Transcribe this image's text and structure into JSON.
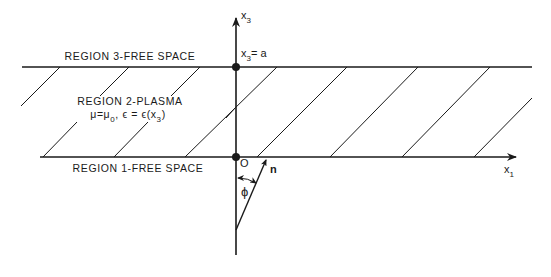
{
  "diagram": {
    "type": "layered-medium-geometry",
    "colors": {
      "line": "#1a1a1a",
      "background": "#ffffff"
    },
    "regions": [
      {
        "id": "region-3",
        "label": "REGION 3-FREE SPACE"
      },
      {
        "id": "region-2",
        "label": "REGION 2-PLASMA",
        "properties": "μ=μ",
        "mu_sub": "0",
        "eps_text": ", ϵ = ϵ(x",
        "eps_sub": "3",
        "eps_close": ")"
      },
      {
        "id": "region-1",
        "label": "REGION 1-FREE SPACE"
      }
    ],
    "axes": {
      "vertical": {
        "label": "x",
        "sub": "3"
      },
      "horizontal": {
        "label": "x",
        "sub": "1"
      }
    },
    "points": {
      "top_boundary": {
        "label": "x",
        "sub": "3",
        "value": "= a"
      },
      "origin": {
        "label": "O"
      }
    },
    "vector": {
      "label": "n"
    },
    "angle": {
      "label": "ϕ"
    }
  }
}
